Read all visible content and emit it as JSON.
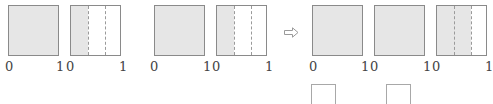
{
  "figure": {
    "groups": [
      {
        "squares": [
          {
            "fill_fraction": 1,
            "divisions": 1,
            "label_left": "0",
            "label_right": "1"
          },
          {
            "fill_fraction": 0.3333,
            "divisions": 3,
            "label_left": "0",
            "label_right": "1"
          }
        ]
      },
      {
        "squares": [
          {
            "fill_fraction": 1,
            "divisions": 1,
            "label_left": "0",
            "label_right": "1"
          },
          {
            "fill_fraction": 0.3333,
            "divisions": 3,
            "label_left": "0",
            "label_right": "1"
          }
        ]
      },
      {
        "squares": [
          {
            "fill_fraction": 1,
            "divisions": 1,
            "label_left": "0",
            "label_right": "1"
          },
          {
            "fill_fraction": 1,
            "divisions": 1,
            "label_left": "0",
            "label_right": "1"
          },
          {
            "fill_fraction": 0.6667,
            "divisions": 3,
            "label_left": "0",
            "label_right": "1"
          }
        ]
      }
    ],
    "arrow_icon": "hollow-right-arrow",
    "answer_blanks": 2,
    "colors": {
      "fill": "#e6e6e6",
      "border": "#8a8a8a",
      "dash": "#9a9a9a"
    }
  },
  "labels": {
    "sq1_l": "0",
    "sq1_r": "1",
    "sq2_l": "0",
    "sq2_r": "1",
    "sq3_l": "0",
    "sq3_r": "1",
    "sq4_l": "0",
    "sq4_r": "1",
    "sq5_l": "0",
    "sq5_r": "1",
    "sq6_l": "0",
    "sq6_r": "1",
    "sq7_l": "0",
    "sq7_r": "1"
  }
}
